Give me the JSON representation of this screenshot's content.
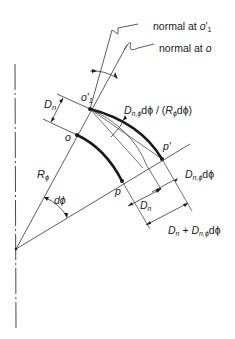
{
  "diagram": {
    "labels": {
      "normal_o1_prefix": "normal at ",
      "normal_o1_var": "o",
      "normal_o1_prime": "′",
      "normal_o1_sub": "1",
      "normal_o_prefix": "normal at ",
      "normal_o_var": "o",
      "Dn_left_D": "D",
      "Dn_left_sub": "n",
      "o1_var": "o",
      "o1_prime": "′",
      "o1_sub": "1",
      "o_point": "o",
      "p_point": "p",
      "p_prime_var": "p",
      "p_prime_mark": "′",
      "R_phi_R": "R",
      "R_phi_sub": "ϕ",
      "dphi": "dϕ",
      "slope_label": {
        "D": "D",
        "sub": "n,ϕ",
        "mid": "dϕ / (",
        "R": "R",
        "Rsub": "ϕ",
        "end": "dϕ)"
      },
      "Dn_phi_dphi": {
        "D": "D",
        "sub": "n,ϕ",
        "end": "dϕ"
      },
      "Dn_bottom": {
        "D": "D",
        "sub": "n"
      },
      "Dn_plus": {
        "D1": "D",
        "sub1": "n",
        "plus": " + ",
        "D2": "D",
        "sub2": "n,ϕ",
        "end": "dϕ"
      }
    },
    "points": {
      "center": [
        16,
        249
      ],
      "o": [
        77,
        135
      ],
      "o1_prime": [
        90,
        109
      ],
      "p": [
        122,
        181
      ],
      "p_prime": [
        162,
        159
      ]
    },
    "colors": {
      "ink": "#1a1a1a",
      "background": "#ffffff"
    }
  }
}
